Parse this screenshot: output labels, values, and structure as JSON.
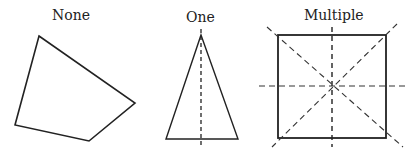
{
  "panels": [
    {
      "label": "None",
      "shape": "irregular-quadrilateral",
      "symmetry_lines": 0
    },
    {
      "label": "One",
      "shape": "isosceles-triangle",
      "symmetry_lines": 1
    },
    {
      "label": "Multiple",
      "shape": "square",
      "symmetry_lines": 4
    }
  ],
  "colors": {
    "stroke": "#222222",
    "background": "#ffffff"
  }
}
